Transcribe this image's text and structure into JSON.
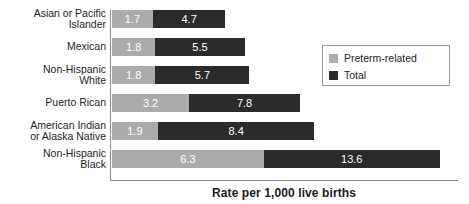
{
  "chart": {
    "xaxis_title": "Rate per 1,000 live births",
    "plot": {
      "x_min": 0,
      "x_max": 14.4,
      "px_per_unit": 24.1,
      "bar_height_px": 18,
      "row_pitch_px": 28
    }
  },
  "legend": {
    "position": "top-right-inside",
    "items": [
      {
        "label": "Preterm-related",
        "color": "#ababab"
      },
      {
        "label": "Total",
        "color": "#2b2b2b"
      }
    ]
  },
  "chart_data": {
    "type": "bar",
    "orientation": "horizontal",
    "title": "",
    "subtitle": "",
    "xlabel": "Rate per 1,000 live births",
    "ylabel": "",
    "xlim": [
      0,
      14.4
    ],
    "grid": false,
    "legend_position": "upper right",
    "categories": [
      "Asian or Pacific\nIslander",
      "Mexican",
      "Non-Hispanic\nWhite",
      "Puerto Rican",
      "American Indian\nor Alaska Native",
      "Non-Hispanic\nBlack"
    ],
    "series": [
      {
        "name": "Preterm-related",
        "color": "#ababab",
        "values": [
          1.7,
          1.8,
          1.8,
          3.2,
          1.9,
          6.3
        ]
      },
      {
        "name": "Total",
        "color": "#2b2b2b",
        "values": [
          4.7,
          5.5,
          5.7,
          7.8,
          8.4,
          13.6
        ]
      }
    ],
    "note": "Each row shows a gray Preterm-related segment drawn from 0 to its value, with the dark Total segment drawn from the Preterm-related value out to the Total value.",
    "rows": [
      {
        "category": "Asian or Pacific Islander",
        "preterm_related": 1.7,
        "total": 4.7
      },
      {
        "category": "Mexican",
        "preterm_related": 1.8,
        "total": 5.5
      },
      {
        "category": "Non-Hispanic White",
        "preterm_related": 1.8,
        "total": 5.7
      },
      {
        "category": "Puerto Rican",
        "preterm_related": 3.2,
        "total": 7.8
      },
      {
        "category": "American Indian or Alaska Native",
        "preterm_related": 1.9,
        "total": 8.4
      },
      {
        "category": "Non-Hispanic Black",
        "preterm_related": 6.3,
        "total": 13.6
      }
    ],
    "value_labels": {
      "preterm_related": [
        "1.7",
        "1.8",
        "1.8",
        "3.2",
        "1.9",
        "6.3"
      ],
      "total": [
        "4.7",
        "5.5",
        "5.7",
        "7.8",
        "8.4",
        "13.6"
      ]
    }
  }
}
